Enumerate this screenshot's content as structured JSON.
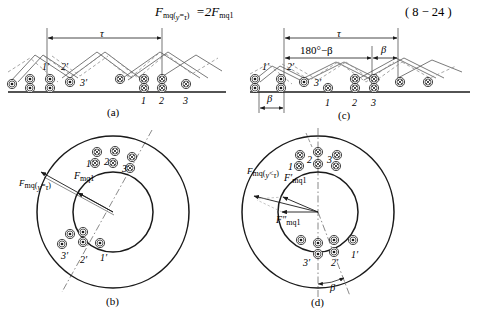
{
  "figure": {
    "equation": {
      "lhs_F": "F",
      "lhs_sub": "mq(",
      "lhs_sub_var": "y",
      "lhs_sub_eq": "=",
      "lhs_sub_tau": "τ",
      "lhs_sub_close": ")",
      "equals": "=",
      "coefficient": "2",
      "rhs_F": "F",
      "rhs_sub": "mq1",
      "full_text": "F mq(y=τ) = 2F mq1",
      "number": "( 8 − 24 )"
    },
    "panels": [
      {
        "id": "a",
        "label": "(a)",
        "type": "developed-winding",
        "dimensions": [
          {
            "name": "tau",
            "label": "τ",
            "kind": "double-arrow"
          }
        ],
        "conductor_groups": [
          {
            "name": "primed-dots",
            "symbol": "dot",
            "labels": [
              "1'",
              "2'",
              "3'"
            ]
          },
          {
            "name": "unprimed-crosses",
            "symbol": "cross",
            "labels": [
              "1",
              "2",
              "3"
            ]
          }
        ]
      },
      {
        "id": "c",
        "label": "(c)",
        "type": "developed-winding",
        "dimensions": [
          {
            "name": "tau",
            "label": "τ",
            "kind": "double-arrow"
          },
          {
            "name": "pitch-main",
            "label": "180°−β",
            "kind": "double-arrow"
          },
          {
            "name": "pitch-remainder",
            "label": "β",
            "kind": "double-arrow"
          },
          {
            "name": "shift-beta",
            "label": "β",
            "kind": "double-arrow"
          }
        ],
        "conductor_groups": [
          {
            "name": "primed-dots",
            "symbol": "dot",
            "labels": [
              "1'",
              "2'",
              "3'"
            ]
          },
          {
            "name": "unprimed-crosses",
            "symbol": "cross",
            "labels": [
              "1",
              "2",
              "3"
            ]
          }
        ]
      },
      {
        "id": "b",
        "label": "(b)",
        "type": "annulus-cross-section",
        "vectors": [
          {
            "name": "resultant",
            "F": "F",
            "sub": "mq(",
            "sub_var": "y",
            "sub_rel": "=",
            "sub_tau": "τ",
            "sub_close": ")",
            "prime": ""
          },
          {
            "name": "fundamental",
            "F": "F",
            "sub": "mq1",
            "prime": ""
          }
        ],
        "conductor_groups": [
          {
            "name": "crosses-top",
            "symbol": "cross",
            "labels": [
              "1",
              "2",
              "3"
            ]
          },
          {
            "name": "dots-bottom",
            "symbol": "dot",
            "labels": [
              "3'",
              "2'",
              "1'"
            ]
          }
        ],
        "axis": "dash-dot"
      },
      {
        "id": "d",
        "label": "(d)",
        "type": "annulus-cross-section",
        "vectors": [
          {
            "name": "resultant",
            "F": "F",
            "sub": "mq(",
            "sub_var": "y",
            "sub_rel": "<",
            "sub_tau": "τ",
            "sub_close": ")",
            "prime": ""
          },
          {
            "name": "component-1",
            "F": "F",
            "sub": "mq1",
            "prime": "′"
          },
          {
            "name": "component-2",
            "F": "F",
            "sub": "mq1",
            "prime": "″"
          }
        ],
        "angles": [
          {
            "name": "beta",
            "label": "β"
          }
        ],
        "conductor_groups": [
          {
            "name": "crosses-top",
            "symbol": "cross",
            "labels": [
              "1",
              "2",
              "3"
            ]
          },
          {
            "name": "dots-bottom",
            "symbol": "dot",
            "labels": [
              "3'",
              "2'",
              "1'"
            ]
          }
        ],
        "axis": "dash-dot"
      }
    ],
    "symbols": {
      "current-out-of-page": "dot-in-circle",
      "current-into-page": "cross-in-circle"
    },
    "colors": {
      "line": "#1a1a1a",
      "dashed": "#6b6b6b",
      "background": "#ffffff"
    }
  }
}
